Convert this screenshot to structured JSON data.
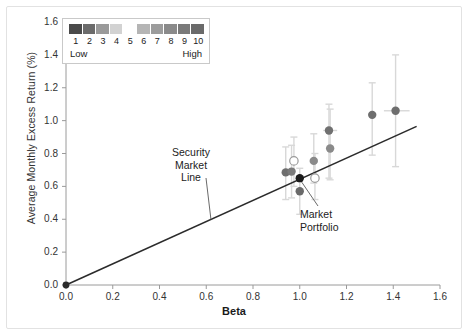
{
  "chart_data": {
    "type": "scatter",
    "title": "",
    "xlabel": "Beta",
    "ylabel": "Average Monthly Excess Return (%)",
    "xlim": [
      0.0,
      1.6
    ],
    "ylim": [
      0.0,
      1.6
    ],
    "xticks": [
      "0.0",
      "0.2",
      "0.4",
      "0.6",
      "0.8",
      "1.0",
      "1.2",
      "1.4",
      "1.6"
    ],
    "yticks": [
      "0.0",
      "0.2",
      "0.4",
      "0.6",
      "0.8",
      "1.0",
      "1.2",
      "1.4",
      "1.6"
    ],
    "grid": false,
    "legend_position": "top-left",
    "series": [
      {
        "name": "Decile portfolios",
        "points": [
          {
            "decile": 1,
            "x": 0.94,
            "y": 0.685,
            "fill": "#6e6e6e",
            "open": false,
            "yerr_low": 0.52,
            "yerr_high": 0.84,
            "xerr_low": null,
            "xerr_high": null
          },
          {
            "decile": 2,
            "x": 0.965,
            "y": 0.69,
            "fill": "#7a7a7a",
            "open": false,
            "yerr_low": 0.53,
            "yerr_high": 0.85,
            "xerr_low": null,
            "xerr_high": null
          },
          {
            "decile": 3,
            "x": 0.975,
            "y": 0.755,
            "fill": "#ffffff",
            "open": true,
            "yerr_low": 0.6,
            "yerr_high": 0.9,
            "xerr_low": null,
            "xerr_high": null
          },
          {
            "decile": 5,
            "x": 1.0,
            "y": 0.57,
            "fill": "#6a6a6a",
            "open": false,
            "yerr_low": 0.43,
            "yerr_high": 0.71,
            "xerr_low": null,
            "xerr_high": null
          },
          {
            "decile": 6,
            "x": 1.06,
            "y": 0.755,
            "fill": "#8a8a8a",
            "open": false,
            "yerr_low": 0.62,
            "yerr_high": 0.92,
            "xerr_low": null,
            "xerr_high": null
          },
          {
            "decile": 7,
            "x": 1.065,
            "y": 0.65,
            "fill": "#ffffff",
            "open": true,
            "yerr_low": 0.52,
            "yerr_high": 0.8,
            "xerr_low": null,
            "xerr_high": null
          },
          {
            "decile": 8,
            "x": 1.125,
            "y": 0.94,
            "fill": "#707070",
            "open": false,
            "yerr_low": 0.65,
            "yerr_high": 1.1,
            "xerr_low": 1.1,
            "xerr_high": 1.16
          },
          {
            "decile": 9,
            "x": 1.13,
            "y": 0.83,
            "fill": "#8a8a8a",
            "open": false,
            "yerr_low": 0.64,
            "yerr_high": 1.07,
            "xerr_low": null,
            "xerr_high": null
          },
          {
            "decile": 10,
            "x": 1.31,
            "y": 1.035,
            "fill": "#6e6e6e",
            "open": false,
            "yerr_low": 0.79,
            "yerr_high": 1.23,
            "xerr_low": null,
            "xerr_high": null
          },
          {
            "decile": 10,
            "x": 1.41,
            "y": 1.06,
            "fill": "#6e6e6e",
            "open": false,
            "yerr_low": 0.72,
            "yerr_high": 1.4,
            "xerr_low": 1.36,
            "xerr_high": 1.47
          }
        ]
      },
      {
        "name": "Market Portfolio",
        "points": [
          {
            "x": 1.0,
            "y": 0.65,
            "fill": "#1a1a1a",
            "open": false,
            "yerr_low": null,
            "yerr_high": null,
            "xerr_low": null,
            "xerr_high": null
          }
        ]
      },
      {
        "name": "Security Market Line",
        "type": "line",
        "x": [
          0.0,
          1.5
        ],
        "y": [
          0.0,
          0.965
        ],
        "origin_marker": {
          "x": 0.0,
          "y": 0.0
        }
      }
    ],
    "annotations": [
      {
        "id": "security-market-line",
        "text": "Security\nMarket\nLine",
        "line1": "Security",
        "line2": "Market",
        "line3": "Line",
        "target_x": 0.62,
        "target_y": 0.4
      },
      {
        "id": "market-portfolio",
        "text": "Market\nPortfolio",
        "line1": "Market",
        "line2": "Portfolio",
        "target_x": 1.0,
        "target_y": 0.65
      }
    ],
    "legend": {
      "low_label": "Low",
      "high_label": "High",
      "numbers": [
        "1",
        "2",
        "3",
        "4",
        "5",
        "6",
        "7",
        "8",
        "9",
        "10"
      ],
      "colors": [
        "#4a4a4a",
        "#6b6b6b",
        "#9a9a9a",
        "#d2d2d2",
        "#ffffff",
        "#b5b5b5",
        "#9c9c9c",
        "#8a8a8a",
        "#7a7a7a",
        "#6a6a6a"
      ]
    },
    "style": {
      "axis_color": "#9a9a9a",
      "text_color": "#333333",
      "line_color": "#2b2b2b",
      "errorbar_color": "#d8d8d8",
      "frame_color": "#e2e2e2"
    }
  }
}
